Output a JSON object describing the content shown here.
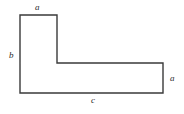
{
  "figure": {
    "name": "l-shaped-polygon",
    "type": "geometry-diagram",
    "background_color": "#ffffff",
    "stroke_color": "#3a3a3a",
    "stroke_width": 1.4,
    "fill_color": "none",
    "canvas": {
      "width": 184,
      "height": 114
    },
    "shape": {
      "description": "L-shaped hexagon (rectilinear polygon)",
      "vertices": [
        {
          "name": "top-left",
          "x": 20,
          "y": 15
        },
        {
          "name": "top-right-of-arm",
          "x": 57,
          "y": 15
        },
        {
          "name": "inner-corner",
          "x": 57,
          "y": 63
        },
        {
          "name": "right-top",
          "x": 163,
          "y": 63
        },
        {
          "name": "bottom-right",
          "x": 163,
          "y": 93
        },
        {
          "name": "bottom-left",
          "x": 20,
          "y": 93
        }
      ],
      "points_attr": "20,15 57,15 57,63 163,63 163,93 20,93"
    },
    "labels": [
      {
        "id": "top-a",
        "text": "a",
        "edge": "top-edge-of-vertical-arm",
        "x": 35,
        "y": 3,
        "position": "above"
      },
      {
        "id": "left-b",
        "text": "b",
        "edge": "left-edge",
        "x": 9,
        "y": 51,
        "position": "left"
      },
      {
        "id": "right-a",
        "text": "a",
        "edge": "right-edge-of-horizontal-arm",
        "x": 170,
        "y": 74,
        "position": "right"
      },
      {
        "id": "bottom-c",
        "text": "c",
        "edge": "bottom-edge",
        "x": 91,
        "y": 96,
        "position": "below"
      }
    ]
  }
}
